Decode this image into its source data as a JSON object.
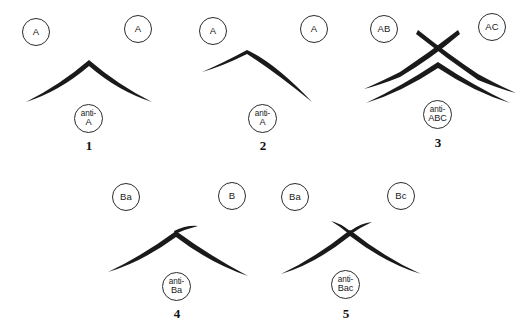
{
  "figure": {
    "background_color": "#ffffff",
    "line_color": "#1a1a1a",
    "well_outline_color": "#2b2b2b"
  },
  "panels": [
    {
      "number": "1",
      "pattern": "identity",
      "left_well": {
        "label": "A",
        "type": "antigen"
      },
      "right_well": {
        "label": "A",
        "type": "antigen"
      },
      "bottom_well": {
        "prefix": "anti-",
        "target": "A",
        "type": "antibody"
      },
      "arcs": [
        {
          "name": "fused-precipitin-arc",
          "style": "continuous-fused",
          "taper": "apex-thick-ends-pointed"
        }
      ]
    },
    {
      "number": "2",
      "pattern": "identity-with-thin-left-limb",
      "left_well": {
        "label": "A",
        "type": "antigen"
      },
      "right_well": {
        "label": "A",
        "type": "antigen"
      },
      "bottom_well": {
        "prefix": "anti-",
        "target": "A",
        "type": "antibody"
      },
      "arcs": [
        {
          "name": "precipitin-arc-thin-left",
          "style": "thin-left-thick-right",
          "taper": "right-heavy"
        }
      ]
    },
    {
      "number": "3",
      "pattern": "non-identity",
      "left_well": {
        "label": "AB",
        "type": "antigen"
      },
      "right_well": {
        "label": "AC",
        "type": "antigen"
      },
      "bottom_well": {
        "prefix": "anti-",
        "target": "ABC",
        "type": "antibody"
      },
      "arcs": [
        {
          "name": "crossing-arc-left-to-right",
          "style": "crossed-line"
        },
        {
          "name": "crossing-arc-right-to-left",
          "style": "crossed-line"
        },
        {
          "name": "inner-fused-arc",
          "style": "continuous-fused"
        }
      ]
    },
    {
      "number": "4",
      "pattern": "partial-identity-single-spur",
      "left_well": {
        "label": "Ba",
        "type": "antigen"
      },
      "right_well": {
        "label": "B",
        "type": "antigen"
      },
      "bottom_well": {
        "prefix": "anti-",
        "target": "Ba",
        "type": "antibody"
      },
      "arcs": [
        {
          "name": "fused-precipitin-arc",
          "style": "continuous-fused",
          "taper": "apex-thick-ends-pointed"
        },
        {
          "name": "spur",
          "style": "single-spur-right",
          "count": 1
        }
      ]
    },
    {
      "number": "5",
      "pattern": "partial-identity-double-spur",
      "left_well": {
        "label": "Ba",
        "type": "antigen"
      },
      "right_well": {
        "label": "Bc",
        "type": "antigen"
      },
      "bottom_well": {
        "prefix": "anti-",
        "target": "Bac",
        "type": "antibody"
      },
      "arcs": [
        {
          "name": "fused-precipitin-arc",
          "style": "continuous-fused",
          "taper": "apex-thick-ends-pointed"
        },
        {
          "name": "spur",
          "style": "double-crossed-spur",
          "count": 2
        }
      ]
    }
  ]
}
